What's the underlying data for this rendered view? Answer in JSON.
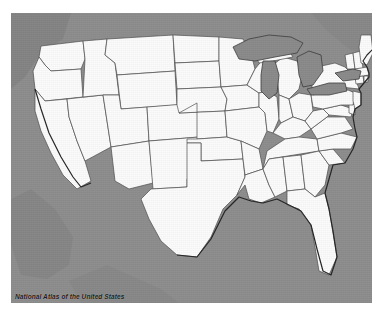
{
  "map": {
    "title": "National Atlas of the United States",
    "caption": "National Atlas of the United States",
    "subject": "Contiguous United States state boundaries",
    "projection_hint": "Albers equal-area conic",
    "colors": {
      "background": "#8d8d8d",
      "land_fill": "#fbfbfb",
      "boundary_line": "#4a4a4a",
      "coastline": "#2b2b2b",
      "lake_fill": "#8a8a8a",
      "lake_outline": "#3c3c3c",
      "page_margin": "#ffffff",
      "caption_text": "#1d1d1d"
    },
    "features": {
      "states_shown": 48,
      "district_shown": "District of Columbia",
      "water_bodies": [
        "Lake Superior",
        "Lake Michigan",
        "Lake Huron",
        "Lake Erie",
        "Lake Ontario",
        "Atlantic Ocean",
        "Pacific Ocean",
        "Gulf of Mexico"
      ],
      "neighbors_shaded": [
        "Canada",
        "Mexico"
      ]
    },
    "states": [
      "Washington",
      "Oregon",
      "California",
      "Nevada",
      "Idaho",
      "Montana",
      "Wyoming",
      "Utah",
      "Arizona",
      "Colorado",
      "New Mexico",
      "North Dakota",
      "South Dakota",
      "Nebraska",
      "Kansas",
      "Oklahoma",
      "Texas",
      "Minnesota",
      "Iowa",
      "Missouri",
      "Arkansas",
      "Louisiana",
      "Wisconsin",
      "Illinois",
      "Michigan",
      "Indiana",
      "Ohio",
      "Kentucky",
      "Tennessee",
      "Mississippi",
      "Alabama",
      "Georgia",
      "Florida",
      "South Carolina",
      "North Carolina",
      "Virginia",
      "West Virginia",
      "Maryland",
      "Delaware",
      "Pennsylvania",
      "New Jersey",
      "New York",
      "Connecticut",
      "Rhode Island",
      "Massachusetts",
      "Vermont",
      "New Hampshire",
      "Maine"
    ]
  }
}
